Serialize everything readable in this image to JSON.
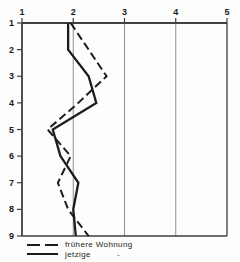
{
  "chart_data": {
    "type": "line",
    "title": "",
    "xlabel": "",
    "ylabel": "",
    "x_axis": {
      "position": "top",
      "min": 1,
      "max": 5,
      "ticks": [
        1,
        2,
        3,
        4,
        5
      ],
      "gridlines": [
        2,
        3,
        4
      ]
    },
    "y_axis": {
      "position": "left",
      "inverted": true,
      "min": 1,
      "max": 9,
      "ticks": [
        1,
        2,
        3,
        4,
        5,
        6,
        7,
        8,
        9
      ]
    },
    "categories": [
      1,
      2,
      3,
      4,
      5,
      6,
      7,
      8,
      9
    ],
    "series": [
      {
        "name": "frühere Wohnung",
        "line_style": "dashed",
        "values": [
          1.95,
          2.3,
          2.65,
          2.1,
          1.5,
          1.95,
          1.7,
          1.9,
          2.3
        ]
      },
      {
        "name": "jetzige",
        "line_style": "solid",
        "values": [
          1.9,
          1.9,
          2.3,
          2.45,
          1.6,
          1.75,
          2.1,
          2.0,
          2.05
        ]
      }
    ],
    "grid": true,
    "legend": {
      "position": "bottom-left"
    }
  },
  "colors": {
    "line": "#1c1c1c",
    "grid": "#8f8f8f",
    "axis": "#3f3f3f",
    "text": "#1a1a1a",
    "background": "#fdfdfb"
  },
  "legend_artifact": "-"
}
